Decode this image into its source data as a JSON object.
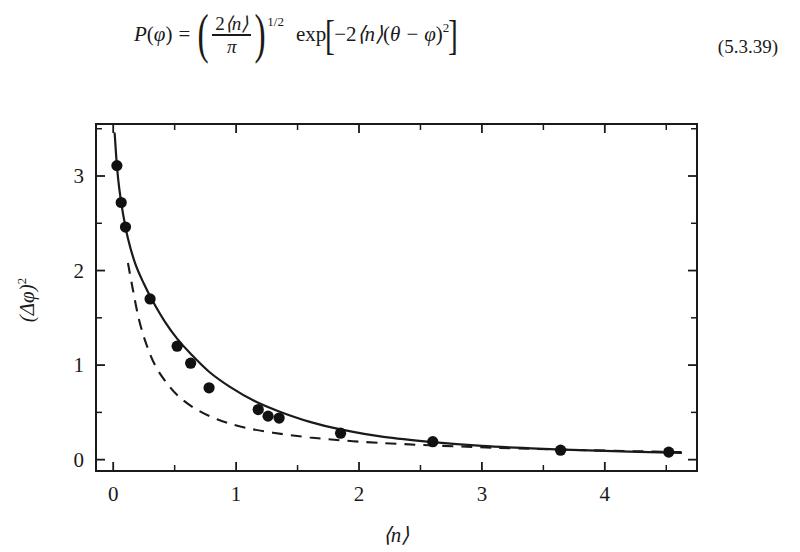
{
  "equation": {
    "lhs_fn": "P",
    "lhs_var": "φ",
    "equals": "=",
    "frac_numerator_coef": "2",
    "frac_numerator_mean": "⟨n⟩",
    "frac_denominator": "π",
    "paren_exponent": "1/2",
    "exp_label": "exp",
    "exp_arg_coef": "−2",
    "exp_arg_mean": "⟨n⟩",
    "exp_arg_theta": "θ",
    "exp_arg_minus": "−",
    "exp_arg_phi": "φ",
    "exp_arg_power": "2",
    "number": "(5.3.39)"
  },
  "figure": {
    "y_axis_label_base": "(Δφ)",
    "y_axis_label_exp": "2",
    "x_axis_label": "⟨n⟩"
  },
  "chart_data": {
    "type": "scatter",
    "title": "",
    "xlabel": "⟨n⟩",
    "ylabel": "(Δφ)²",
    "xlim": [
      -0.14,
      4.75
    ],
    "ylim": [
      -0.12,
      3.55
    ],
    "xticks": [
      0,
      1,
      2,
      3,
      4
    ],
    "xtick_labels": [
      "0",
      "1",
      "2",
      "3",
      "4"
    ],
    "x_minor_ticks": [
      0.5,
      1.5,
      2.5,
      3.5,
      4.5
    ],
    "yticks": [
      0,
      1,
      2,
      3
    ],
    "ytick_labels": [
      "0",
      "1",
      "2",
      "3"
    ],
    "y_minor_ticks": [
      0.5,
      1.5,
      2.5,
      3.5
    ],
    "grid": false,
    "legend_position": "none",
    "tick_direction": "in",
    "frame": "full-box",
    "series": [
      {
        "name": "measured-data-points",
        "type": "scatter",
        "marker": "filled-circle",
        "color": "#111111",
        "points": [
          [
            0.03,
            3.11
          ],
          [
            0.065,
            2.72
          ],
          [
            0.1,
            2.46
          ],
          [
            0.3,
            1.7
          ],
          [
            0.52,
            1.2
          ],
          [
            0.63,
            1.02
          ],
          [
            0.78,
            0.76
          ],
          [
            1.18,
            0.53
          ],
          [
            1.26,
            0.46
          ],
          [
            1.35,
            0.44
          ],
          [
            1.85,
            0.28
          ],
          [
            2.6,
            0.19
          ],
          [
            3.64,
            0.1
          ],
          [
            4.52,
            0.08
          ]
        ]
      },
      {
        "name": "theory-solid-curve",
        "type": "line",
        "style": "solid",
        "color": "#111111",
        "description": "upper solid theoretical curve passing through the data",
        "x": [
          0.012,
          0.03,
          0.05,
          0.08,
          0.12,
          0.18,
          0.25,
          0.32,
          0.42,
          0.52,
          0.63,
          0.78,
          0.95,
          1.15,
          1.35,
          1.6,
          1.85,
          2.2,
          2.6,
          3.0,
          3.4,
          3.8,
          4.2,
          4.62
        ],
        "y": [
          3.45,
          3.11,
          2.86,
          2.6,
          2.34,
          2.07,
          1.86,
          1.68,
          1.46,
          1.28,
          1.12,
          0.93,
          0.77,
          0.62,
          0.51,
          0.4,
          0.32,
          0.24,
          0.185,
          0.145,
          0.12,
          0.1,
          0.085,
          0.072
        ]
      },
      {
        "name": "poisson-dashed-curve",
        "type": "line",
        "style": "dashed",
        "color": "#111111",
        "description": "lower dashed curve (1/(4⟨n⟩) limit)",
        "x": [
          0.12,
          0.16,
          0.21,
          0.27,
          0.34,
          0.43,
          0.54,
          0.68,
          0.85,
          1.05,
          1.3,
          1.6,
          1.95,
          2.35,
          2.8,
          3.3,
          3.85,
          4.4,
          4.68
        ],
        "y": [
          2.08,
          1.8,
          1.48,
          1.22,
          1.0,
          0.82,
          0.66,
          0.53,
          0.425,
          0.345,
          0.285,
          0.235,
          0.195,
          0.165,
          0.14,
          0.118,
          0.1,
          0.085,
          0.078
        ]
      }
    ]
  }
}
